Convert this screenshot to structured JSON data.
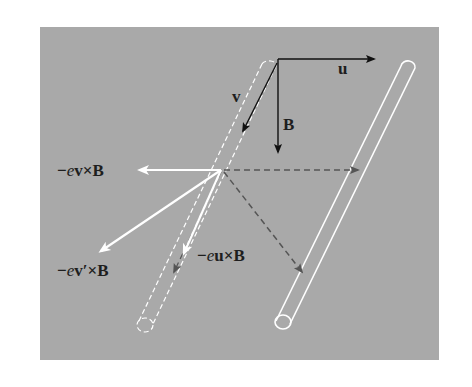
{
  "diagram": {
    "background": "#a9a9a9",
    "panel": {
      "x": 40,
      "y": 27,
      "width": 399,
      "height": 333
    },
    "colors": {
      "black_arrow": "#111111",
      "white_arrow": "#ffffff",
      "dashed_arrow": "#555555",
      "rod_outline": "#ffffff",
      "text": "#1e1e1e"
    },
    "labels": {
      "u": "u",
      "v": "v",
      "B": "B",
      "force_v": {
        "minus": "−",
        "e": "e",
        "rest": "v×B"
      },
      "force_vprime": {
        "minus": "−",
        "e": "e",
        "rest": "v′×B"
      },
      "force_u": {
        "minus": "−",
        "e": "e",
        "rest": "u×B"
      }
    },
    "vectors": [
      {
        "name": "u",
        "from": [
          278,
          59
        ],
        "to": [
          374,
          59
        ],
        "style": "solid-black"
      },
      {
        "name": "B",
        "from": [
          278,
          59
        ],
        "to": [
          278,
          152
        ],
        "style": "solid-black"
      },
      {
        "name": "v",
        "from": [
          278,
          62
        ],
        "to": [
          242,
          132
        ],
        "style": "solid-black"
      },
      {
        "name": "-ev×B",
        "from": [
          221,
          170
        ],
        "to": [
          137,
          170
        ],
        "style": "solid-white"
      },
      {
        "name": "-ev'×B",
        "from": [
          221,
          170
        ],
        "to": [
          98,
          253
        ],
        "style": "solid-white"
      },
      {
        "name": "-eu component",
        "from": [
          221,
          170
        ],
        "to": [
          183,
          256
        ],
        "style": "solid-white"
      },
      {
        "name": "horizontal dashed",
        "from": [
          222,
          170
        ],
        "to": [
          360,
          170
        ],
        "style": "dashed-gray"
      },
      {
        "name": "diagonal dashed",
        "from": [
          222,
          170
        ],
        "to": [
          304,
          274
        ],
        "style": "dashed-gray"
      },
      {
        "name": "rod-moving dashed",
        "from": [
          222,
          170
        ],
        "to": [
          172,
          275
        ],
        "style": "dashed-gray"
      }
    ],
    "rods": [
      {
        "name": "initial-rod",
        "style": "dashed",
        "top": [
          269,
          64
        ],
        "bottom": [
          145,
          325
        ]
      },
      {
        "name": "moved-rod",
        "style": "solid",
        "top": [
          408,
          66
        ],
        "bottom": [
          283,
          322
        ]
      }
    ]
  }
}
